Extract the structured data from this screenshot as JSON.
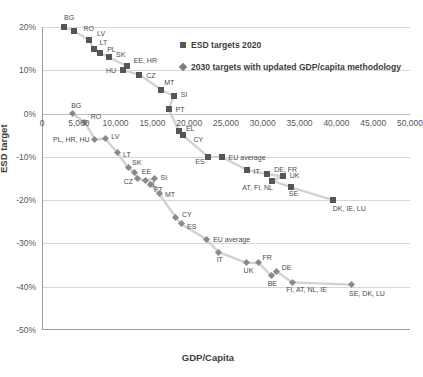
{
  "chart_data": {
    "type": "scatter",
    "title": "",
    "xlabel": "GDP/Capita",
    "ylabel": "ESD target",
    "xlim": [
      0,
      50000
    ],
    "ylim": [
      -0.5,
      0.2
    ],
    "grid": true,
    "legend_position": "top-right",
    "xticks": [
      "0",
      "5,000",
      "10,000",
      "15,000",
      "20,000",
      "25,000",
      "30,000",
      "35,000",
      "40,000",
      "45,000",
      "50,000"
    ],
    "xtick_values": [
      0,
      5000,
      10000,
      15000,
      20000,
      25000,
      30000,
      35000,
      40000,
      45000,
      50000
    ],
    "yticks": [
      "20%",
      "10%",
      "0%",
      "-10%",
      "-20%",
      "-30%",
      "-40%",
      "-50%"
    ],
    "ytick_values": [
      0.2,
      0.1,
      0.0,
      -0.1,
      -0.2,
      -0.3,
      -0.4,
      -0.5
    ],
    "series": [
      {
        "name": "ESD targets 2020",
        "marker": "square",
        "color": "#565656",
        "points": [
          {
            "label": "BG",
            "x": 3000,
            "y": 0.2,
            "lx": 0,
            "ly": -10
          },
          {
            "label": "RO",
            "x": 4400,
            "y": 0.19,
            "lx": 9,
            "ly": -3
          },
          {
            "label": "LV",
            "x": 6400,
            "y": 0.17,
            "lx": 8,
            "ly": -7
          },
          {
            "label": "LT",
            "x": 7000,
            "y": 0.15,
            "lx": 6,
            "ly": -7
          },
          {
            "label": "PL",
            "x": 7900,
            "y": 0.14,
            "lx": 7,
            "ly": -4
          },
          {
            "label": "SK",
            "x": 9100,
            "y": 0.13,
            "lx": 7,
            "ly": -3
          },
          {
            "label": "EE, HR",
            "x": 11500,
            "y": 0.11,
            "lx": 7,
            "ly": -6
          },
          {
            "label": "HU",
            "x": 11000,
            "y": 0.1,
            "lx": -17,
            "ly": 0
          },
          {
            "label": "CZ",
            "x": 13200,
            "y": 0.09,
            "lx": 7,
            "ly": 0
          },
          {
            "label": "MT",
            "x": 16200,
            "y": 0.055,
            "lx": 3,
            "ly": -8
          },
          {
            "label": "SI",
            "x": 17900,
            "y": 0.04,
            "lx": 7,
            "ly": -2
          },
          {
            "label": "PT",
            "x": 17200,
            "y": 0.01,
            "lx": 7,
            "ly": 0
          },
          {
            "label": "EL",
            "x": 18600,
            "y": -0.04,
            "lx": 7,
            "ly": -3
          },
          {
            "label": "CY",
            "x": 19100,
            "y": -0.05,
            "lx": 11,
            "ly": 4
          },
          {
            "label": "ES",
            "x": 22600,
            "y": -0.1,
            "lx": -13,
            "ly": 4
          },
          {
            "label": "EU average",
            "x": 24400,
            "y": -0.1,
            "lx": 7,
            "ly": 0
          },
          {
            "label": "IT",
            "x": 27800,
            "y": -0.13,
            "lx": 7,
            "ly": 1
          },
          {
            "label": "DE, FR",
            "x": 30600,
            "y": -0.14,
            "lx": 7,
            "ly": -5
          },
          {
            "label": "UK",
            "x": 32700,
            "y": -0.145,
            "lx": 7,
            "ly": -1
          },
          {
            "label": "AT, FI, NL",
            "x": 31300,
            "y": -0.155,
            "lx": -30,
            "ly": 6
          },
          {
            "label": "SE",
            "x": 33800,
            "y": -0.17,
            "lx": -2,
            "ly": 6
          },
          {
            "label": "DK, IE, LU",
            "x": 39500,
            "y": -0.2,
            "lx": 0,
            "ly": 8
          }
        ]
      },
      {
        "name": "2030 targets with updated GDP/capita methodology",
        "marker": "diamond",
        "color": "#8a8a8a",
        "points": [
          {
            "label": "BG",
            "x": 4100,
            "y": 0.0,
            "lx": -1,
            "ly": -9
          },
          {
            "label": "RO",
            "x": 5800,
            "y": -0.02,
            "lx": 6,
            "ly": -6
          },
          {
            "label": "PL, HR, HU",
            "x": 7200,
            "y": -0.06,
            "lx": -42,
            "ly": -1
          },
          {
            "label": "LV",
            "x": 8600,
            "y": -0.058,
            "lx": 6,
            "ly": -3
          },
          {
            "label": "LT",
            "x": 10200,
            "y": -0.09,
            "lx": 6,
            "ly": 1
          },
          {
            "label": "SK",
            "x": 11700,
            "y": -0.125,
            "lx": 4,
            "ly": -6
          },
          {
            "label": "EE",
            "x": 12600,
            "y": -0.135,
            "lx": 7,
            "ly": -1
          },
          {
            "label": "CZ",
            "x": 13000,
            "y": -0.15,
            "lx": -14,
            "ly": 2
          },
          {
            "label": "EL",
            "x": 14000,
            "y": -0.155,
            "lx": 3,
            "ly": 3
          },
          {
            "label": "SI",
            "x": 15300,
            "y": -0.15,
            "lx": 6,
            "ly": -2
          },
          {
            "label": "PT",
            "x": 14800,
            "y": -0.165,
            "lx": 3,
            "ly": 4
          },
          {
            "label": "MT",
            "x": 15900,
            "y": -0.185,
            "lx": 6,
            "ly": 0
          },
          {
            "label": "CY",
            "x": 18200,
            "y": -0.24,
            "lx": 6,
            "ly": -3
          },
          {
            "label": "ES",
            "x": 18900,
            "y": -0.255,
            "lx": 6,
            "ly": 2
          },
          {
            "label": "EU average",
            "x": 22300,
            "y": -0.29,
            "lx": 7,
            "ly": 0
          },
          {
            "label": "IT",
            "x": 24000,
            "y": -0.32,
            "lx": -2,
            "ly": 7
          },
          {
            "label": "UK",
            "x": 27800,
            "y": -0.345,
            "lx": -3,
            "ly": 7
          },
          {
            "label": "FR",
            "x": 29400,
            "y": -0.345,
            "lx": 4,
            "ly": -6
          },
          {
            "label": "BE",
            "x": 31200,
            "y": -0.375,
            "lx": -4,
            "ly": 7
          },
          {
            "label": "DE",
            "x": 31900,
            "y": -0.365,
            "lx": 5,
            "ly": -5
          },
          {
            "label": "FI, AT, NL, IE",
            "x": 34000,
            "y": -0.39,
            "lx": -6,
            "ly": 7
          },
          {
            "label": "SE, DK, LU",
            "x": 42000,
            "y": -0.395,
            "lx": -2,
            "ly": 8
          }
        ]
      }
    ]
  },
  "legend": {
    "entries": [
      {
        "label": "ESD targets 2020"
      },
      {
        "label": "2030 targets with updated GDP/capita methodology"
      }
    ]
  }
}
